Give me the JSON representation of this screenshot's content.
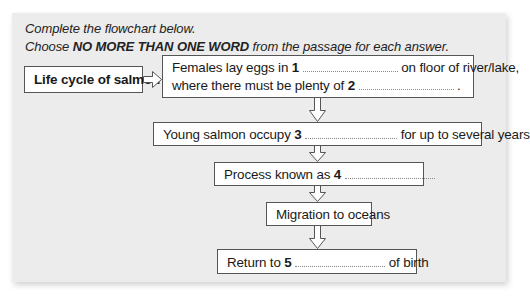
{
  "instructions": {
    "line1": "Complete the flowchart below.",
    "line2_prefix": "Choose ",
    "line2_bold": "NO MORE THAN ONE WORD",
    "line2_suffix": " from the passage for each answer."
  },
  "flowchart": {
    "title": "Life cycle of salmon",
    "steps": [
      {
        "line1_prefix": "Females lay eggs in ",
        "line1_num": "1",
        "line1_suffix": "on floor of river/lake,",
        "line2_prefix": "where there must be plenty of ",
        "line2_num": "2",
        "line2_suffix": "."
      },
      {
        "prefix": "Young salmon occupy ",
        "num": "3",
        "suffix": "for up to several years"
      },
      {
        "prefix": "Process known as ",
        "num": "4",
        "suffix": ""
      },
      {
        "text": "Migration to oceans"
      },
      {
        "prefix": "Return to ",
        "num": "5",
        "suffix": "of birth"
      }
    ]
  },
  "colors": {
    "panel_bg": "#ececec",
    "box_bg": "#ffffff",
    "border": "#555555"
  }
}
